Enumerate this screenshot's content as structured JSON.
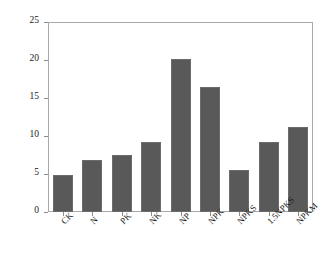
{
  "chart_data": {
    "type": "bar",
    "title": "",
    "subtitle": "",
    "xlabel": "",
    "ylabel": "固碳效率 (CSE)/%",
    "categories": [
      "CK",
      "N",
      "PK",
      "NK",
      "NP",
      "NPK",
      "NPKS",
      "1.5NPKS",
      "NPKM"
    ],
    "values": [
      4.9,
      6.8,
      7.5,
      9.2,
      20.1,
      16.4,
      5.5,
      9.2,
      11.2
    ],
    "series": [
      {
        "name": "固碳效率 (CSE)/%",
        "values": [
          4.9,
          6.8,
          7.5,
          9.2,
          20.1,
          16.4,
          5.5,
          9.2,
          11.2
        ]
      }
    ],
    "ylim": [
      0,
      25
    ],
    "yticks": [
      0,
      5,
      10,
      15,
      20,
      25
    ],
    "ytick_labels": [
      "0",
      "5",
      "10",
      "15",
      "20",
      "25"
    ],
    "grid": false,
    "legend": false,
    "legend_position": "none",
    "bar_color": "#595959",
    "frame_color": "#a9a9a9",
    "background_color": "#ffffff",
    "text_color": "#1a1a1a"
  },
  "axes": {
    "y_axis_title": "固碳效率 (CSE)/%",
    "x_axis_title": ""
  }
}
